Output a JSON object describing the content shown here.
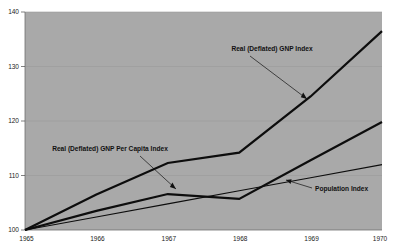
{
  "chart_data": {
    "type": "line",
    "title": "",
    "xlabel": "",
    "ylabel": "",
    "x": [
      1965,
      1966,
      1967,
      1968,
      1969,
      1970
    ],
    "xlim": [
      1965,
      1970
    ],
    "ylim": [
      100,
      140
    ],
    "yticks": [
      100,
      110,
      120,
      130,
      140
    ],
    "xticks": [
      1965,
      1966,
      1967,
      1968,
      1969,
      1970
    ],
    "grid": true,
    "legend_position": "inline-annotations",
    "background_color": "#a9a9a9",
    "line_color": "#0d0d0d",
    "series": [
      {
        "name": "Real (Deflated) GNP Index",
        "values": [
          100,
          106.5,
          112.3,
          114.2,
          124.5,
          136.5
        ]
      },
      {
        "name": "Real (Deflated) GNP Per Capita Index",
        "values": [
          100,
          103.5,
          106.6,
          105.7,
          112.8,
          119.8
        ]
      },
      {
        "name": "Population Index",
        "values": [
          100,
          102.4,
          104.8,
          107.2,
          109.6,
          112.0
        ]
      }
    ],
    "annotations": [
      {
        "text": "Real (Deflated) GNP Index"
      },
      {
        "text": "Real (Deflated) GNP Per Capita Index"
      },
      {
        "text": "Population Index"
      }
    ],
    "ytick_labels": [
      "100",
      "110",
      "120",
      "130",
      "140"
    ],
    "xtick_labels": [
      "1965",
      "1966",
      "1967",
      "1968",
      "1969",
      "1970"
    ]
  }
}
